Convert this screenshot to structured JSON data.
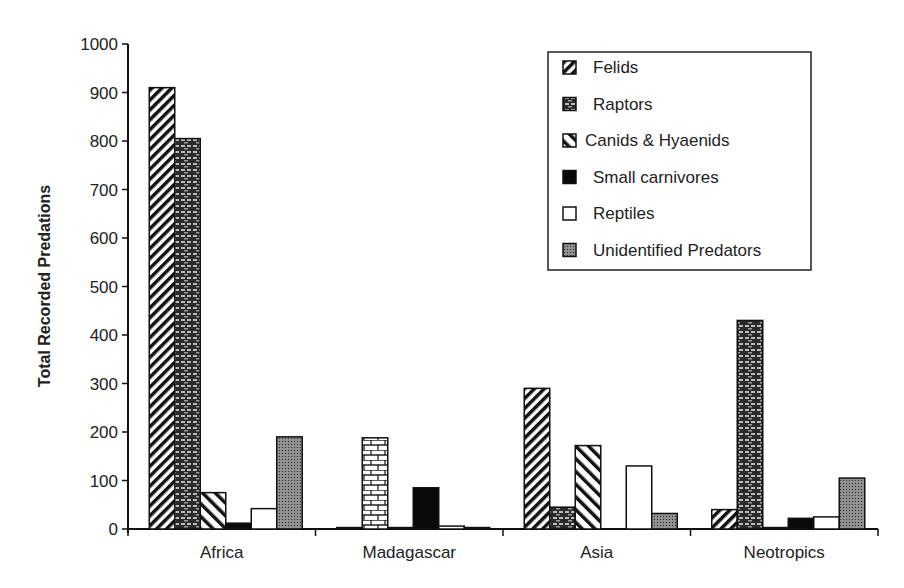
{
  "chart_data": {
    "type": "bar",
    "title": "",
    "xlabel": "",
    "ylabel": "Total Recorded Predations",
    "ylim": [
      0,
      1000
    ],
    "yticks": [
      0,
      100,
      200,
      300,
      400,
      500,
      600,
      700,
      800,
      900,
      1000
    ],
    "grid": false,
    "legend_position": "top-right",
    "categories": [
      "Africa",
      "Madagascar",
      "Asia",
      "Neotropics"
    ],
    "series": [
      {
        "name": "Felids",
        "pattern": "diagonal-hatch-dense",
        "values": [
          910,
          3,
          290,
          40
        ]
      },
      {
        "name": "Raptors",
        "pattern": "dark-brick",
        "values": [
          805,
          188,
          45,
          430
        ]
      },
      {
        "name": "Canids & Hyaenids",
        "pattern": "diagonal-hatch-wide",
        "values": [
          75,
          3,
          172,
          3
        ]
      },
      {
        "name": "Small carnivores",
        "pattern": "solid-black",
        "values": [
          12,
          85,
          0,
          22
        ]
      },
      {
        "name": "Reptiles",
        "pattern": "white",
        "values": [
          42,
          6,
          130,
          25
        ]
      },
      {
        "name": "Unidentified Predators",
        "pattern": "stipple-gray",
        "values": [
          190,
          3,
          32,
          105
        ]
      }
    ]
  }
}
